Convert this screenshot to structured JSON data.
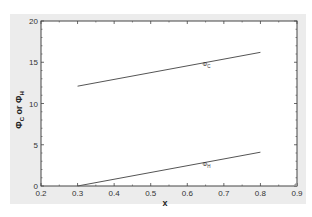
{
  "chart_data": {
    "type": "line",
    "title": "",
    "xlabel": "x",
    "ylabel": "Φ_C or Φ_H",
    "xlim": [
      0.2,
      0.9
    ],
    "ylim": [
      0,
      20
    ],
    "xticks": [
      0.2,
      0.3,
      0.4,
      0.5,
      0.6,
      0.7,
      0.8,
      0.9
    ],
    "xtick_labels": [
      "0.2",
      "0.3",
      "0.4",
      "0.5",
      "0.6",
      "0.7",
      "0.8",
      "0.9"
    ],
    "yticks": [
      0,
      5,
      10,
      15,
      20
    ],
    "ytick_labels": [
      "0",
      "5",
      "10",
      "15",
      "20"
    ],
    "grid": false,
    "legend": "none (inline curve labels)",
    "series": [
      {
        "name": "Φ_C",
        "label": "ΦC",
        "x": [
          0.3,
          0.8
        ],
        "y": [
          12.1,
          16.2
        ],
        "label_at": {
          "x": 0.65,
          "y": 14.8
        }
      },
      {
        "name": "Φ_H",
        "label": "ΦH",
        "x": [
          0.3,
          0.8
        ],
        "y": [
          0.0,
          4.1
        ],
        "label_at": {
          "x": 0.65,
          "y": 2.7
        }
      }
    ]
  },
  "labels": {
    "x_axis": "x",
    "y_axis_main": "Φ",
    "y_axis_sub1": "C",
    "y_axis_or": " or ",
    "y_axis_main2": "Φ",
    "y_axis_sub2": "H",
    "curve_c_main": "Φ",
    "curve_c_sub": "C",
    "curve_h_main": "Φ",
    "curve_h_sub": "H"
  },
  "colors": {
    "line": "#555555",
    "axis": "#444444",
    "panel": "#ececec",
    "plot_bg": "#ffffff"
  }
}
